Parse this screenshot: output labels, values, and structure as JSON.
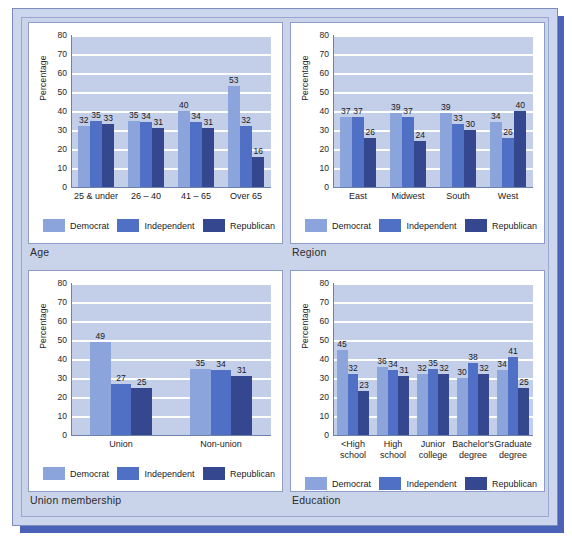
{
  "document": {
    "kind": "scanned-figure-page",
    "series_names": [
      "Democrat",
      "Independent",
      "Republican"
    ],
    "series_colors": [
      "#8ba4dc",
      "#4f70c4",
      "#35478f"
    ],
    "plot_background": "#c3cfe9",
    "page_background": "#c9d4ea",
    "shadow_color": "#4a62b8",
    "axis_label": "Percentage",
    "y_ticks": [
      "0",
      "10",
      "20",
      "30",
      "40",
      "50",
      "60",
      "70",
      "80"
    ]
  },
  "panels": [
    {
      "id": "age",
      "caption": "Age",
      "chart_data": {
        "type": "bar",
        "title": "Age",
        "xlabel": "",
        "ylabel": "Percentage",
        "ylim": [
          0,
          80
        ],
        "yticks": [
          0,
          10,
          20,
          30,
          40,
          50,
          60,
          70,
          80
        ],
        "grid": true,
        "legend_position": "bottom",
        "categories": [
          "25 & under",
          "26 – 40",
          "41 – 65",
          "Over 65"
        ],
        "series": [
          {
            "name": "Democrat",
            "color": "#8ba4dc",
            "values": [
              32,
              35,
              40,
              53
            ]
          },
          {
            "name": "Independent",
            "color": "#4f70c4",
            "values": [
              35,
              34,
              34,
              32
            ]
          },
          {
            "name": "Republican",
            "color": "#35478f",
            "values": [
              33,
              31,
              31,
              16
            ]
          }
        ]
      }
    },
    {
      "id": "region",
      "caption": "Region",
      "chart_data": {
        "type": "bar",
        "title": "Region",
        "xlabel": "",
        "ylabel": "Percentage",
        "ylim": [
          0,
          80
        ],
        "yticks": [
          0,
          10,
          20,
          30,
          40,
          50,
          60,
          70,
          80
        ],
        "grid": true,
        "legend_position": "bottom",
        "categories": [
          "East",
          "Midwest",
          "South",
          "West"
        ],
        "series": [
          {
            "name": "Democrat",
            "color": "#8ba4dc",
            "values": [
              37,
              39,
              39,
              34
            ]
          },
          {
            "name": "Independent",
            "color": "#4f70c4",
            "values": [
              37,
              37,
              33,
              26
            ]
          },
          {
            "name": "Republican",
            "color": "#35478f",
            "values": [
              26,
              24,
              30,
              40
            ]
          }
        ]
      }
    },
    {
      "id": "union",
      "caption": "Union membership",
      "chart_data": {
        "type": "bar",
        "title": "Union membership",
        "xlabel": "",
        "ylabel": "Percentage",
        "ylim": [
          0,
          80
        ],
        "yticks": [
          0,
          10,
          20,
          30,
          40,
          50,
          60,
          70,
          80
        ],
        "grid": true,
        "legend_position": "bottom",
        "categories": [
          "Union",
          "Non-union"
        ],
        "series": [
          {
            "name": "Democrat",
            "color": "#8ba4dc",
            "values": [
              49,
              35
            ]
          },
          {
            "name": "Independent",
            "color": "#4f70c4",
            "values": [
              27,
              34
            ]
          },
          {
            "name": "Republican",
            "color": "#35478f",
            "values": [
              25,
              31
            ]
          }
        ]
      }
    },
    {
      "id": "education",
      "caption": "Education",
      "chart_data": {
        "type": "bar",
        "title": "Education",
        "xlabel": "",
        "ylabel": "Percentage",
        "ylim": [
          0,
          80
        ],
        "yticks": [
          0,
          10,
          20,
          30,
          40,
          50,
          60,
          70,
          80
        ],
        "grid": true,
        "legend_position": "bottom",
        "categories": [
          "<High\nschool",
          "High\nschool",
          "Junior\ncollege",
          "Bachelor's\ndegree",
          "Graduate\ndegree"
        ],
        "series": [
          {
            "name": "Democrat",
            "color": "#8ba4dc",
            "values": [
              45,
              36,
              32,
              30,
              34
            ]
          },
          {
            "name": "Independent",
            "color": "#4f70c4",
            "values": [
              32,
              34,
              35,
              38,
              41
            ]
          },
          {
            "name": "Republican",
            "color": "#35478f",
            "values": [
              23,
              31,
              32,
              32,
              25
            ]
          }
        ]
      }
    }
  ]
}
